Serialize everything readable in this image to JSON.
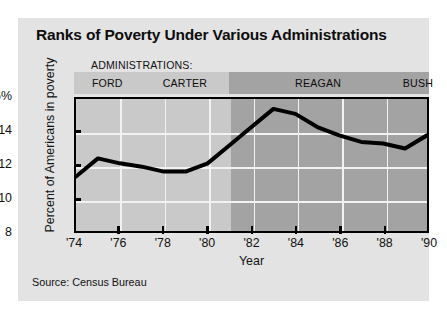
{
  "figure": {
    "title": "Ranks of Poverty Under Various Administrations",
    "source": "Source: Census Bureau",
    "admin_header": "ADMINISTRATIONS:",
    "background": "#e3e3e3",
    "line_color": "#000000"
  },
  "chart_data": {
    "type": "line",
    "title": "Ranks of Poverty Under Various Administrations",
    "xlabel": "Year",
    "ylabel": "Percent of Americans in poverty",
    "ylim": [
      8,
      16
    ],
    "xlim": [
      1974,
      1990
    ],
    "grid": true,
    "legend": "none",
    "ytick_labels": [
      "16%",
      "14",
      "12",
      "10",
      "8"
    ],
    "ytick_values": [
      16,
      14,
      12,
      10,
      8
    ],
    "xtick_labels": [
      "'74",
      "'76",
      "'78",
      "'80",
      "'82",
      "'84",
      "'86",
      "'88",
      "'90"
    ],
    "xtick_values": [
      1974,
      1976,
      1978,
      1980,
      1982,
      1984,
      1986,
      1988,
      1990
    ],
    "x": [
      1974,
      1975,
      1976,
      1977,
      1978,
      1979,
      1980,
      1981,
      1982,
      1983,
      1984,
      1985,
      1986,
      1987,
      1988,
      1989,
      1990
    ],
    "values": [
      11.3,
      12.4,
      12.1,
      11.9,
      11.6,
      11.6,
      12.1,
      13.2,
      14.3,
      15.4,
      15.1,
      14.3,
      13.8,
      13.4,
      13.3,
      13.0,
      13.8
    ],
    "series": [
      {
        "name": "Percent of Americans in poverty",
        "values": [
          11.3,
          12.4,
          12.1,
          11.9,
          11.6,
          11.6,
          12.1,
          13.2,
          14.3,
          15.4,
          15.1,
          14.3,
          13.8,
          13.4,
          13.3,
          13.0,
          13.8
        ]
      }
    ],
    "bands": [
      {
        "label": "FORD",
        "start": 1974,
        "end": 1977,
        "color": "#c9c9c9"
      },
      {
        "label": "CARTER",
        "start": 1977,
        "end": 1981,
        "color": "#c9c9c9"
      },
      {
        "label": "REAGAN",
        "start": 1981,
        "end": 1989,
        "color": "#a3a3a3"
      },
      {
        "label": "BUSH",
        "start": 1989,
        "end": 1991,
        "color": "#a3a3a3"
      }
    ],
    "annotations": [
      "ADMINISTRATIONS:",
      "Source: Census Bureau"
    ]
  }
}
